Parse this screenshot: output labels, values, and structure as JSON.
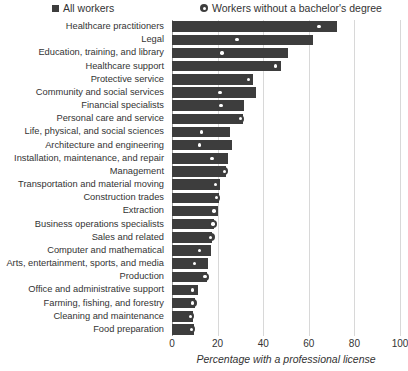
{
  "legend": {
    "all_workers": "All workers",
    "no_bachelors": "Workers without a bachelor's degree",
    "all_workers_icon": "filled-square-marker",
    "no_bachelors_icon": "filled-circle-marker"
  },
  "axis": {
    "xlabel": "Percentage with a professional license",
    "ticks": [
      "0",
      "20",
      "40",
      "60",
      "80",
      "100"
    ]
  },
  "colors": {
    "bar": "#3d3d3d",
    "marker": "#3d3d3d",
    "grid": "#d8d8d8",
    "text": "#333333",
    "background": "#ffffff"
  },
  "chart_data": {
    "type": "bar",
    "orientation": "horizontal",
    "title": "",
    "subtitle": "",
    "xlabel": "Percentage with a professional license",
    "ylabel": "",
    "xlim": [
      0,
      100
    ],
    "xticks": [
      0,
      20,
      40,
      60,
      80,
      100
    ],
    "grid": "vertical",
    "legend_position": "top",
    "categories": [
      "Healthcare practitioners",
      "Legal",
      "Education, training, and library",
      "Healthcare support",
      "Protective service",
      "Community and social services",
      "Financial specialists",
      "Personal care and service",
      "Life, physical, and social sciences",
      "Architecture and engineering",
      "Installation, maintenance, and repair",
      "Management",
      "Transportation and material moving",
      "Construction trades",
      "Extraction",
      "Business operations specialists",
      "Sales and related",
      "Computer and mathematical",
      "Arts, entertainment, sports, and media",
      "Production",
      "Office and administrative support",
      "Farming, fishing, and forestry",
      "Cleaning and maintenance",
      "Food preparation"
    ],
    "series": [
      {
        "name": "All workers",
        "marker": "bar",
        "values": [
          72.5,
          62.0,
          51.0,
          48.0,
          35.5,
          37.0,
          31.5,
          31.0,
          25.5,
          26.5,
          24.5,
          23.5,
          21.0,
          20.5,
          20.0,
          18.5,
          17.5,
          17.0,
          16.0,
          15.5,
          11.5,
          10.0,
          9.0,
          9.5
        ]
      },
      {
        "name": "Workers without a bachelor's degree",
        "marker": "circle",
        "values": [
          64.5,
          28.5,
          22.0,
          45.5,
          33.5,
          21.0,
          21.5,
          30.0,
          13.0,
          12.0,
          17.5,
          23.0,
          19.0,
          19.5,
          18.5,
          18.0,
          17.0,
          12.0,
          10.0,
          14.5,
          9.0,
          9.0,
          8.0,
          8.5
        ]
      }
    ]
  }
}
